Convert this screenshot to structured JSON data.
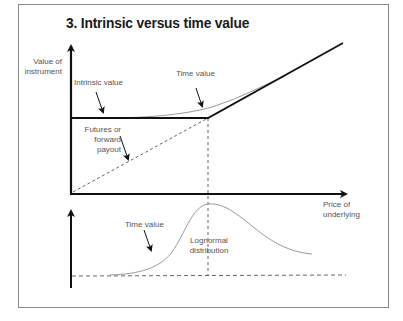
{
  "title": "3. Intrinsic versus time value",
  "labels": {
    "y_axis": [
      "Value of",
      "instrument"
    ],
    "x_axis": [
      "Price of",
      "underlying"
    ],
    "intrinsic_value": "Intrinsic value",
    "time_value_upper": "Time value",
    "futures": [
      "Futures or",
      "forward",
      "payout"
    ],
    "time_value_lower": "Time value",
    "lognormal": [
      "Lognormal",
      "distribution"
    ]
  },
  "colors": {
    "axis": "#111111",
    "curve": "#9a9a9a",
    "dashed": "#555555",
    "frame": "#8a8a8a",
    "text": "#555555"
  }
}
